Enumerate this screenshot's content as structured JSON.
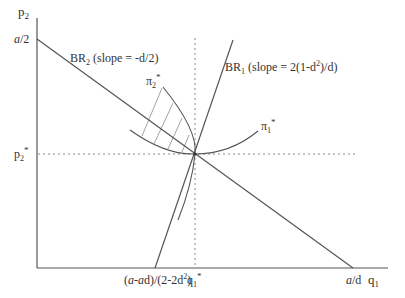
{
  "diagram": {
    "type": "economics-best-response",
    "axes": {
      "x_label": "q",
      "x_label_sub": "1",
      "y_label": "p",
      "y_label_sub": "2"
    },
    "y_ticks": {
      "top_a": "a",
      "top_rest": "/2",
      "eq_p": "p",
      "eq_sub": "2",
      "eq_star": "*"
    },
    "x_ticks": {
      "br1_intercept_a1": "(",
      "br1_intercept_a": "a",
      "br1_intercept_mid": "-",
      "br1_intercept_a2": "a",
      "br1_intercept_rest": "d)/(2-2d",
      "br1_intercept_sup": "2",
      "br1_intercept_close": ")",
      "eq_q": "q",
      "eq_sub": "1",
      "eq_star": "*",
      "br2_intercept_a": "a",
      "br2_intercept_rest": "/d"
    },
    "lines": {
      "br2": {
        "name": "BR",
        "sub": "2",
        "slope_text": " (slope = -d/2)"
      },
      "br1": {
        "name": "BR",
        "sub": "1",
        "slope_text_pre": " (slope = 2(1-d",
        "slope_sup": "2",
        "slope_text_post": ")/d)"
      }
    },
    "isoprofits": {
      "pi2": {
        "sym": "π",
        "sub": "2",
        "star": "*"
      },
      "pi1": {
        "sym": "π",
        "sub": "1",
        "star": "*"
      }
    },
    "colors": {
      "line": "#555555",
      "text": "#333333",
      "dotted": "#888888",
      "hatch": "#999999"
    }
  }
}
